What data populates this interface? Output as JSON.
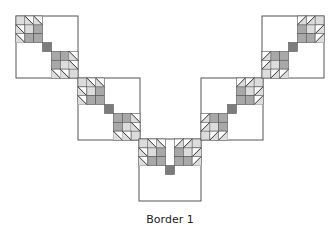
{
  "caption": "Border 1",
  "colors": {
    "outline": "#555555",
    "light": "#dcdcdc",
    "mid": "#a8a8a8",
    "dark": "#7c7c7c",
    "background": "#ffffff"
  },
  "grid_units": 7,
  "blocks": [
    {
      "name": "block-1",
      "x": 16,
      "y": 16,
      "size": 62,
      "orientation": "down-right"
    },
    {
      "name": "block-2",
      "x": 78,
      "y": 78,
      "size": 62,
      "orientation": "down-right"
    },
    {
      "name": "block-3",
      "x": 139,
      "y": 139,
      "size": 62,
      "orientation": "center"
    },
    {
      "name": "block-4",
      "x": 201,
      "y": 78,
      "size": 62,
      "orientation": "up-right"
    },
    {
      "name": "block-5",
      "x": 262,
      "y": 16,
      "size": 62,
      "orientation": "up-right"
    }
  ]
}
